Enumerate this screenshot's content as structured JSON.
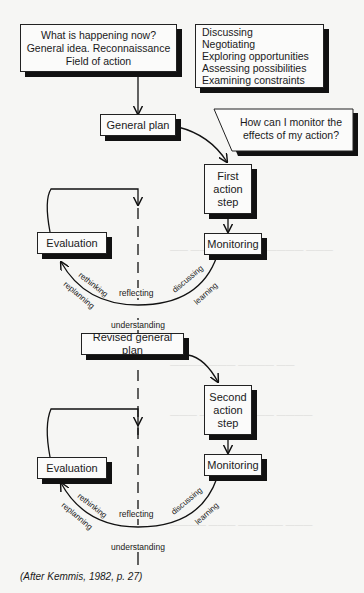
{
  "diagram": {
    "start_box": [
      "What is happening now?",
      "General idea. Reconnaissance",
      "Field of action"
    ],
    "activities_box": [
      "Discussing",
      "Negotiating",
      "Exploring opportunities",
      "Assessing possibilities",
      "Examining constraints"
    ],
    "question_callout": [
      "How can I monitor the",
      "effects of my action?"
    ],
    "cycle1": {
      "plan": "General plan",
      "action": [
        "First",
        "action",
        "step"
      ],
      "monitoring": "Monitoring",
      "evaluation": "Evaluation",
      "arc_labels": {
        "rethinking": "rethinking",
        "replanning": "replanning",
        "reflecting": "reflecting",
        "discussing": "discussing",
        "learning": "learning"
      },
      "understanding": "understanding"
    },
    "cycle2": {
      "plan": "Revised general plan",
      "action": [
        "Second",
        "action",
        "step"
      ],
      "monitoring": "Monitoring",
      "evaluation": "Evaluation",
      "arc_labels": {
        "rethinking": "rethinking",
        "replanning": "replanning",
        "reflecting": "reflecting",
        "discussing": "discussing",
        "learning": "learning"
      },
      "understanding": "understanding"
    },
    "caption": "(After Kemmis, 1982, p. 27)"
  }
}
